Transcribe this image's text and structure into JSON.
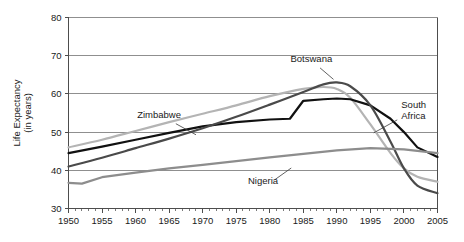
{
  "chart_data": {
    "type": "line",
    "title": "",
    "subtitle": "",
    "xlabel": "",
    "ylabel": "Life Expectancy\n(in years)",
    "ylabel_line1": "Life Expectancy",
    "ylabel_line2": "(in years)",
    "xlim": [
      1950,
      2005
    ],
    "ylim": [
      30,
      80
    ],
    "y_ticks": [
      30,
      40,
      50,
      60,
      70,
      80
    ],
    "x_ticks": [
      1950,
      1955,
      1960,
      1965,
      1970,
      1975,
      1980,
      1985,
      1990,
      1995,
      2000,
      2005
    ],
    "x_tick_labels": [
      "1950",
      "1955",
      "1960",
      "1965",
      "1970",
      "1975",
      "1980",
      "1985",
      "1990",
      "1995",
      "2000",
      "2005"
    ],
    "y_tick_labels": [
      "30",
      "40",
      "50",
      "60",
      "70",
      "80"
    ],
    "x_minor_step": 1,
    "grid": "horizontal",
    "legend": "inline-annotations",
    "legend_position": "none",
    "series": [
      {
        "name": "Zimbabwe",
        "color": "#b4b4b4",
        "label_x": 1963.5,
        "label_y": 53.6,
        "leader_from": [
          1966.0,
          52.2
        ],
        "leader_to": [
          1969.0,
          49.3
        ],
        "x": [
          1950,
          1955,
          1960,
          1965,
          1970,
          1975,
          1980,
          1985,
          1988,
          1990,
          1992,
          1995,
          1998,
          2000,
          2002,
          2005
        ],
        "values": [
          46.0,
          48.0,
          50.3,
          52.6,
          54.8,
          57.0,
          59.4,
          61.3,
          61.8,
          61.3,
          59.0,
          52.0,
          44.5,
          40.5,
          38.3,
          37.0
        ]
      },
      {
        "name": "South Africa",
        "color": "#111111",
        "label_x": 1999.6,
        "label_y": 56.2,
        "label_line1": "South",
        "label_line2": "Africa",
        "leader_from": [
          1999.0,
          53.2
        ],
        "leader_to": [
          1995.5,
          49.8
        ],
        "x": [
          1950,
          1955,
          1960,
          1965,
          1970,
          1975,
          1980,
          1983,
          1985,
          1988,
          1990,
          1992,
          1995,
          1998,
          2000,
          2002,
          2005
        ],
        "values": [
          44.5,
          46.2,
          48.0,
          49.8,
          51.5,
          52.6,
          53.3,
          53.5,
          58.2,
          58.6,
          58.8,
          58.6,
          57.0,
          53.5,
          50.0,
          46.0,
          43.5
        ]
      },
      {
        "name": "Botswana",
        "color": "#4a4a4a",
        "label_x": 1986.2,
        "label_y": 68.3,
        "leader_from": [
          1987.5,
          66.8
        ],
        "leader_to": [
          1989.5,
          63.8
        ],
        "x": [
          1950,
          1955,
          1960,
          1965,
          1970,
          1975,
          1980,
          1985,
          1988,
          1990,
          1992,
          1995,
          1998,
          2000,
          2002,
          2005
        ],
        "values": [
          41.0,
          43.3,
          45.8,
          48.3,
          51.0,
          54.0,
          57.2,
          60.5,
          62.5,
          63.0,
          62.0,
          57.0,
          47.5,
          40.5,
          36.0,
          34.0
        ]
      },
      {
        "name": "Nigeria",
        "color": "#8d8d8d",
        "label_x": 1979.0,
        "label_y": 36.3,
        "leader_from": [
          1980.8,
          37.6
        ],
        "leader_to": [
          1983.2,
          40.6
        ],
        "x": [
          1950,
          1952,
          1955,
          1960,
          1965,
          1970,
          1975,
          1980,
          1985,
          1990,
          1995,
          2000,
          2005
        ],
        "values": [
          36.7,
          36.5,
          38.2,
          39.4,
          40.5,
          41.4,
          42.4,
          43.4,
          44.3,
          45.2,
          45.8,
          45.5,
          44.5
        ]
      }
    ],
    "annotations": [
      {
        "text": "Zimbabwe",
        "series": "Zimbabwe"
      },
      {
        "text": "Botswana",
        "series": "Botswana"
      },
      {
        "text": "South Africa",
        "series": "South Africa"
      },
      {
        "text": "Nigeria",
        "series": "Nigeria"
      }
    ]
  },
  "colors": {
    "background": "#ffffff",
    "axis": "#4d4d4d",
    "grid": "#8f8f8f",
    "text": "#1a1a1a"
  }
}
